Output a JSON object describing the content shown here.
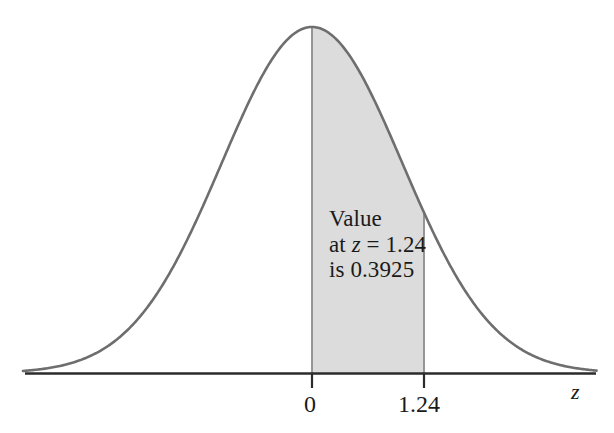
{
  "figure": {
    "kind": "normal-distribution-area-diagram",
    "background_color": "#ffffff"
  },
  "colors": {
    "curve": "#6e6e6e",
    "axis": "#2b2b2b",
    "shade_fill": "#dcdcdc",
    "shade_edge": "#8c8c8c",
    "text": "#1a1a1a"
  },
  "annotation": {
    "line1": "Value",
    "line2_prefix": "at ",
    "line2_var": "z",
    "line2_suffix": " = 1.24",
    "line3": "is 0.3925"
  },
  "axis": {
    "name": "z",
    "ticks": [
      {
        "label": "0",
        "value": 0
      },
      {
        "label": "1.24",
        "value": 1.24
      }
    ]
  },
  "chart_data": {
    "type": "area",
    "title": "",
    "xlabel": "z",
    "ylabel": "",
    "grid": false,
    "legend": null,
    "xlim": [
      -3.2,
      3.15
    ],
    "ylim": [
      0,
      0.4
    ],
    "distribution": {
      "name": "standard normal",
      "mean": 0,
      "std": 1,
      "peak_density": 0.3989
    },
    "shaded_region": {
      "from": 0,
      "to": 1.24,
      "area": 0.3925,
      "fill": "#dcdcdc"
    },
    "annotations": [
      {
        "text": "Value at z = 1.24 is 0.3925",
        "x": 0.62,
        "y": 0.18
      }
    ],
    "xticks": [
      0,
      1.24
    ],
    "xticklabels": [
      "0",
      "1.24"
    ],
    "yticks": [],
    "yticklabels": [],
    "x": [
      -3.2,
      -3.0,
      -2.8,
      -2.6,
      -2.4,
      -2.2,
      -2.0,
      -1.8,
      -1.6,
      -1.4,
      -1.2,
      -1.0,
      -0.8,
      -0.6,
      -0.4,
      -0.2,
      0.0,
      0.2,
      0.4,
      0.6,
      0.8,
      1.0,
      1.24,
      1.4,
      1.6,
      1.8,
      2.0,
      2.2,
      2.4,
      2.6,
      2.8,
      3.0,
      3.15
    ],
    "y": [
      0.0024,
      0.0044,
      0.0079,
      0.0136,
      0.0224,
      0.0355,
      0.054,
      0.079,
      0.1109,
      0.1497,
      0.1942,
      0.242,
      0.2897,
      0.3332,
      0.3683,
      0.391,
      0.3989,
      0.391,
      0.3683,
      0.3332,
      0.2897,
      0.242,
      0.1849,
      0.1497,
      0.1109,
      0.079,
      0.054,
      0.0355,
      0.0224,
      0.0136,
      0.0079,
      0.0044,
      0.0029
    ]
  }
}
